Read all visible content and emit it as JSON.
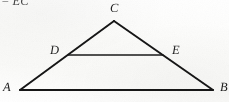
{
  "figure": {
    "kind": "geometry-diagram",
    "width": 229,
    "height": 102,
    "background_color": "#fdfdfc",
    "ink_color": "#141414"
  },
  "annotations": {
    "top_fragment": "= EC"
  },
  "labels": {
    "apex": "C",
    "left_base": "A",
    "right_base": "B",
    "left_mid": "D",
    "right_mid": "E"
  },
  "points": {
    "A": {
      "x": 20,
      "y": 90
    },
    "B": {
      "x": 213,
      "y": 90
    },
    "C": {
      "x": 114,
      "y": 21
    },
    "D": {
      "x": 68,
      "y": 55
    },
    "E": {
      "x": 163,
      "y": 55
    }
  },
  "segments": [
    {
      "name": "AC",
      "from": "A",
      "to": "C",
      "color": "#141414",
      "width": 1.9
    },
    {
      "name": "CB",
      "from": "C",
      "to": "B",
      "color": "#141414",
      "width": 1.9
    },
    {
      "name": "AB",
      "from": "A",
      "to": "B",
      "color": "#141414",
      "width": 1.9
    },
    {
      "name": "DE",
      "from": "D",
      "to": "E",
      "color": "#1a1a1a",
      "width": 1.5
    }
  ],
  "tints": {
    "midsegment_green": "#2f6b4a",
    "base_red": "#8a3a3a"
  }
}
